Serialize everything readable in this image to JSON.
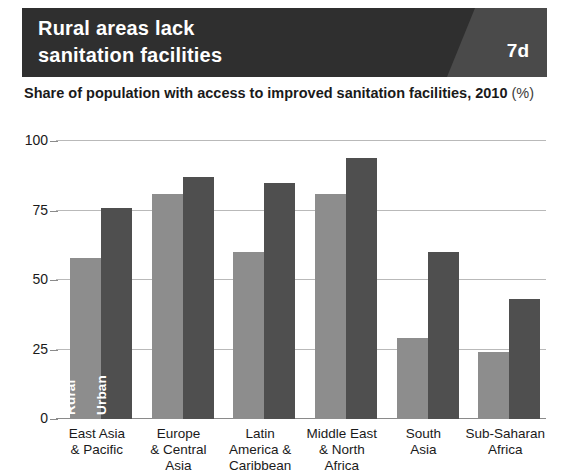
{
  "header": {
    "title": "Rural areas lack\nsanitation facilities",
    "badge": "7d",
    "bg_color": "#2f2f2f",
    "wedge_color": "#4a4a4a"
  },
  "subtitle": {
    "lead": "Share of population with access to improved sanitation facilities,",
    "year": "2010",
    "unit": "(%)"
  },
  "chart_data": {
    "type": "bar",
    "title": "Rural areas lack sanitation facilities",
    "subtitle": "Share of population with access to improved sanitation facilities, 2010 (%)",
    "xlabel": "",
    "ylabel": "",
    "ylim": [
      0,
      100
    ],
    "yticks": [
      0,
      25,
      50,
      75,
      100
    ],
    "ytick_labels": [
      "0",
      "25",
      "50",
      "75",
      "100"
    ],
    "grid": true,
    "legend_position": "in-bars-first-group",
    "categories": [
      "East Asia\n& Pacific",
      "Europe\n& Central\nAsia",
      "Latin\nAmerica &\nCaribbean",
      "Middle East\n& North\nAfrica",
      "South\nAsia",
      "Sub-Saharan\nAfrica"
    ],
    "series": [
      {
        "name": "Rural",
        "color": "#8d8d8d",
        "values": [
          58,
          81,
          60,
          81,
          29,
          24
        ]
      },
      {
        "name": "Urban",
        "color": "#4f4f4f",
        "values": [
          76,
          87,
          85,
          94,
          60,
          43
        ]
      }
    ]
  }
}
